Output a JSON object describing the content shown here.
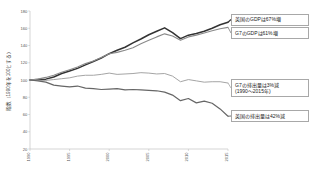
{
  "chart_data": {
    "type": "line",
    "title": "",
    "xlabel": "",
    "ylabel": "指数（1990年を100とする）",
    "xlim": [
      1990,
      2015
    ],
    "ylim": [
      20,
      180
    ],
    "grid": false,
    "legend_position": "callout-labels",
    "x_ticks": [
      "1990",
      "1995",
      "2000",
      "2005",
      "2010",
      "2015"
    ],
    "y_ticks": [
      "180",
      "160",
      "140",
      "120",
      "100",
      "80",
      "60",
      "40",
      "20"
    ],
    "x": [
      1990,
      1991,
      1992,
      1993,
      1994,
      1995,
      1996,
      1997,
      1998,
      1999,
      2000,
      2001,
      2002,
      2003,
      2004,
      2005,
      2006,
      2007,
      2008,
      2009,
      2010,
      2011,
      2012,
      2013,
      2014,
      2015
    ],
    "series": [
      {
        "name": "英国のGDP",
        "color": "#333333",
        "width": 1.5,
        "values": [
          100,
          100.5,
          101,
          103.5,
          107.5,
          110.5,
          113.5,
          117.5,
          121.5,
          125.5,
          130.5,
          134.5,
          138,
          143,
          147.5,
          152.5,
          156.5,
          160.5,
          155,
          148,
          152,
          154,
          156.5,
          160,
          164,
          167
        ]
      },
      {
        "name": "G7のGDP",
        "color": "#8a8a8a",
        "width": 1.1,
        "values": [
          100,
          101,
          103,
          105.5,
          109,
          112,
          115,
          119,
          122,
          126,
          130.5,
          132,
          134.5,
          137.5,
          142,
          146,
          150,
          153.5,
          151,
          146,
          150,
          152,
          154.5,
          157,
          159.5,
          161
        ]
      },
      {
        "name": "G7の排出量",
        "color": "#a5a5a5",
        "width": 1.0,
        "values": [
          100,
          99.5,
          99.5,
          100.5,
          101.5,
          102.5,
          104.5,
          105.5,
          105.5,
          106.5,
          108,
          106.5,
          107,
          107.5,
          108.5,
          108,
          107,
          107.5,
          104.5,
          98,
          100.5,
          99,
          97.5,
          98,
          98,
          96.5
        ]
      },
      {
        "name": "英国の排出量",
        "color": "#666666",
        "width": 1.2,
        "values": [
          100,
          99,
          97.5,
          94,
          93,
          92,
          93,
          90.5,
          90,
          89,
          89.5,
          90,
          88.5,
          89,
          88.5,
          88,
          87.5,
          86,
          82.5,
          76,
          78.5,
          73.5,
          75.5,
          73,
          66.5,
          58
        ]
      }
    ],
    "annotations": [
      {
        "id": "uk-gdp",
        "lines": [
          "英国のGDPは67%増"
        ]
      },
      {
        "id": "g7-gdp",
        "lines": [
          "G7のGDPは61%増"
        ]
      },
      {
        "id": "g7-emis",
        "lines": [
          "G7の排出量は3%減",
          "(1990〜2015年)"
        ]
      },
      {
        "id": "uk-emis",
        "lines": [
          "英国の排出量は42%減"
        ]
      }
    ]
  }
}
